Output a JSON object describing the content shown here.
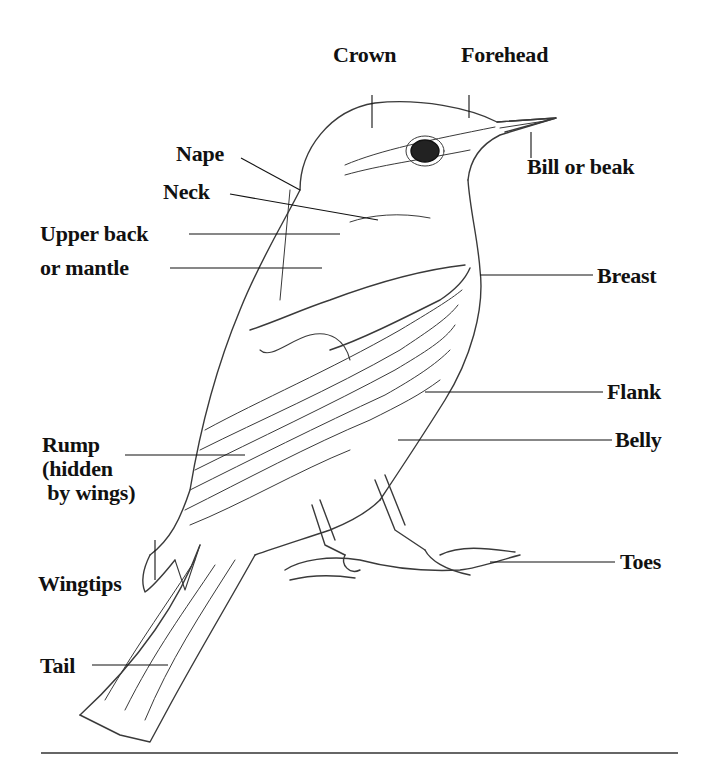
{
  "diagram": {
    "labels": {
      "crown": "Crown",
      "forehead": "Forehead",
      "nape": "Nape",
      "bill": "Bill or beak",
      "neck": "Neck",
      "upper_back_line1": "Upper back",
      "upper_back_line2": "or mantle",
      "breast": "Breast",
      "flank": "Flank",
      "rump": "Rump\n(hidden\n by wings)",
      "belly": "Belly",
      "toes": "Toes",
      "wingtips": "Wingtips",
      "tail": "Tail"
    },
    "colors": {
      "ink": "#111111",
      "sketch": "#333333",
      "background": "#ffffff"
    }
  }
}
